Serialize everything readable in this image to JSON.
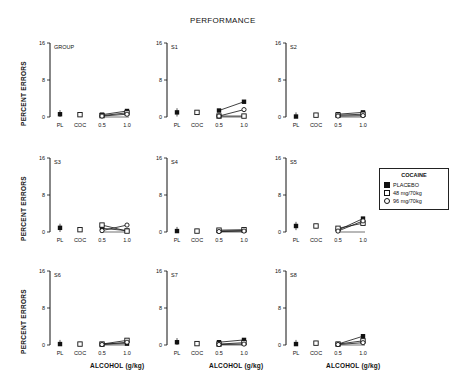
{
  "figure": {
    "title": "PERFORMANCE",
    "ylabel": "PERCENT ERRORS",
    "xlabel": "ALCOHOL (g/kg)",
    "legend": {
      "title": "COCAINE",
      "items": [
        {
          "label": "PLACEBO",
          "marker": "filled-square"
        },
        {
          "label": "48 mg/70kg",
          "marker": "open-square"
        },
        {
          "label": "96 mg/70kg",
          "marker": "open-circle"
        }
      ]
    }
  },
  "chart_data": {
    "type": "line",
    "title": "PERFORMANCE",
    "xlabel": "ALCOHOL (g/kg)",
    "ylabel": "PERCENT ERRORS",
    "ylim": [
      0,
      16
    ],
    "yticks": [
      0,
      8,
      16
    ],
    "categories": [
      "PL",
      "COC",
      "0.5",
      "1.0"
    ],
    "legend_title": "COCAINE",
    "legend_position": "right",
    "grid": false,
    "panels": [
      {
        "label": "GROUP",
        "PL": 0.6,
        "COC": 0.5,
        "series": [
          {
            "name": "PLACEBO",
            "values": [
              0.5,
              1.3
            ]
          },
          {
            "name": "48 mg/70kg",
            "values": [
              0.3,
              0.9
            ]
          },
          {
            "name": "96 mg/70kg",
            "values": [
              0.2,
              0.6
            ]
          }
        ]
      },
      {
        "label": "S1",
        "PL": 1.0,
        "COC": 1.0,
        "series": [
          {
            "name": "PLACEBO",
            "values": [
              1.4,
              3.3
            ]
          },
          {
            "name": "48 mg/70kg",
            "values": [
              0.2,
              0.2
            ]
          },
          {
            "name": "96 mg/70kg",
            "values": [
              0.2,
              1.6
            ]
          }
        ]
      },
      {
        "label": "S2",
        "PL": 0.1,
        "COC": 0.4,
        "series": [
          {
            "name": "PLACEBO",
            "values": [
              0.6,
              1.0
            ]
          },
          {
            "name": "48 mg/70kg",
            "values": [
              0.4,
              0.6
            ]
          },
          {
            "name": "96 mg/70kg",
            "values": [
              0.2,
              0.3
            ]
          }
        ]
      },
      {
        "label": "S3",
        "PL": 0.9,
        "COC": 0.5,
        "series": [
          {
            "name": "PLACEBO",
            "values": [
              0.8,
              0.3
            ]
          },
          {
            "name": "48 mg/70kg",
            "values": [
              1.5,
              0.2
            ]
          },
          {
            "name": "96 mg/70kg",
            "values": [
              0.3,
              1.5
            ]
          }
        ]
      },
      {
        "label": "S4",
        "PL": 0.2,
        "COC": 0.2,
        "series": [
          {
            "name": "PLACEBO",
            "values": [
              0.2,
              0.3
            ]
          },
          {
            "name": "48 mg/70kg",
            "values": [
              0.4,
              0.5
            ]
          },
          {
            "name": "96 mg/70kg",
            "values": [
              0.1,
              0.2
            ]
          }
        ]
      },
      {
        "label": "S5",
        "PL": 1.3,
        "COC": 1.3,
        "series": [
          {
            "name": "PLACEBO",
            "values": [
              0.4,
              2.9
            ]
          },
          {
            "name": "48 mg/70kg",
            "values": [
              0.8,
              1.9
            ]
          },
          {
            "name": "96 mg/70kg",
            "values": [
              0.2,
              2.4
            ]
          }
        ]
      },
      {
        "label": "S6",
        "PL": 0.2,
        "COC": 0.2,
        "series": [
          {
            "name": "PLACEBO",
            "values": [
              0.2,
              0.3
            ]
          },
          {
            "name": "48 mg/70kg",
            "values": [
              0.2,
              1.0
            ]
          },
          {
            "name": "96 mg/70kg",
            "values": [
              0.1,
              0.6
            ]
          }
        ]
      },
      {
        "label": "S7",
        "PL": 0.6,
        "COC": 0.3,
        "series": [
          {
            "name": "PLACEBO",
            "values": [
              0.6,
              1.1
            ]
          },
          {
            "name": "48 mg/70kg",
            "values": [
              0.2,
              0.5
            ]
          },
          {
            "name": "96 mg/70kg",
            "values": [
              0.1,
              0.2
            ]
          }
        ]
      },
      {
        "label": "S8",
        "PL": 0.2,
        "COC": 0.4,
        "series": [
          {
            "name": "PLACEBO",
            "values": [
              0.2,
              1.9
            ]
          },
          {
            "name": "48 mg/70kg",
            "values": [
              0.2,
              0.9
            ]
          },
          {
            "name": "96 mg/70kg",
            "values": [
              0.1,
              0.5
            ]
          }
        ]
      }
    ]
  }
}
